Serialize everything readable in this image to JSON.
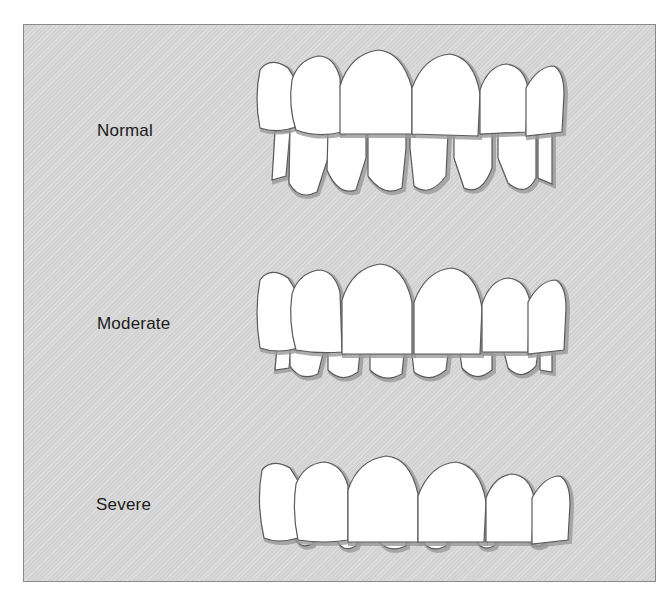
{
  "diagram": {
    "type": "dental-illustration",
    "rows": [
      {
        "id": "normal",
        "label": "Normal"
      },
      {
        "id": "moderate",
        "label": "Moderate"
      },
      {
        "id": "severe",
        "label": "Severe"
      }
    ]
  },
  "colors": {
    "background": "#d9d9d9",
    "border": "#8a8a8a",
    "tooth_fill": "#ffffff",
    "tooth_outline": "#5a5a5a",
    "shadow": "#9a9a9a",
    "label_text": "#1a1a1a"
  }
}
